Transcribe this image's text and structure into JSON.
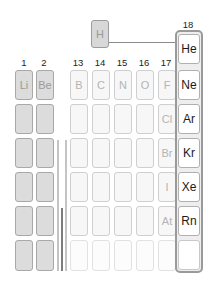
{
  "diagram": {
    "title_visible": false,
    "hydrogen": {
      "symbol": "H"
    },
    "group_labels": {
      "g1": "1",
      "g2": "2",
      "g13": "13",
      "g14": "14",
      "g15": "15",
      "g16": "16",
      "g17": "17",
      "g18": "18"
    },
    "groups": {
      "g1": [
        "Li",
        "",
        "",
        "",
        "",
        ""
      ],
      "g2": [
        "Be",
        "",
        "",
        "",
        "",
        ""
      ],
      "g13": [
        "B",
        "",
        "",
        "",
        "",
        ""
      ],
      "g14": [
        "C",
        "",
        "",
        "",
        "",
        ""
      ],
      "g15": [
        "N",
        "",
        "",
        "",
        "",
        ""
      ],
      "g16": [
        "O",
        "",
        "",
        "",
        "",
        ""
      ],
      "g17": [
        "F",
        "Cl",
        "Br",
        "I",
        "At",
        ""
      ],
      "g18": [
        "He",
        "Ne",
        "Ar",
        "Kr",
        "Xe",
        "Rn",
        ""
      ]
    },
    "colors": {
      "s_block_fill": "#dcdcdc",
      "p_block_fill": "#f7f7f7",
      "noble_gas_frame": "#9a9a9a",
      "noble_gas_text": "#1a1a1a",
      "faded_text": "#b4b4b4",
      "transition_gap_lines": [
        "#bdbdbd",
        "#7a7a7a"
      ]
    }
  }
}
